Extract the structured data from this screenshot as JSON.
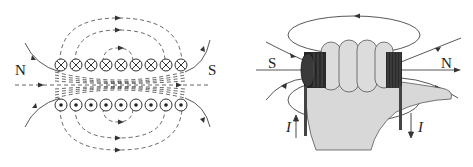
{
  "left_diagram": {
    "title": "Solenoid cross-section magnetic field",
    "pole_left": "N",
    "pole_right": "S",
    "top_row_symbol": "into-page (⊗)",
    "bottom_row_symbol": "out-of-page (⊙)",
    "conductors_per_row": 9
  },
  "right_diagram": {
    "title": "Right-hand grip rule on solenoid",
    "pole_left": "S",
    "pole_right": "N",
    "current_label_left": "I",
    "current_label_right": "I"
  },
  "colors": {
    "line": "#333333",
    "background": "#ffffff",
    "hand_fill": "#d8d8d8",
    "coil": "#2a2a2a"
  }
}
